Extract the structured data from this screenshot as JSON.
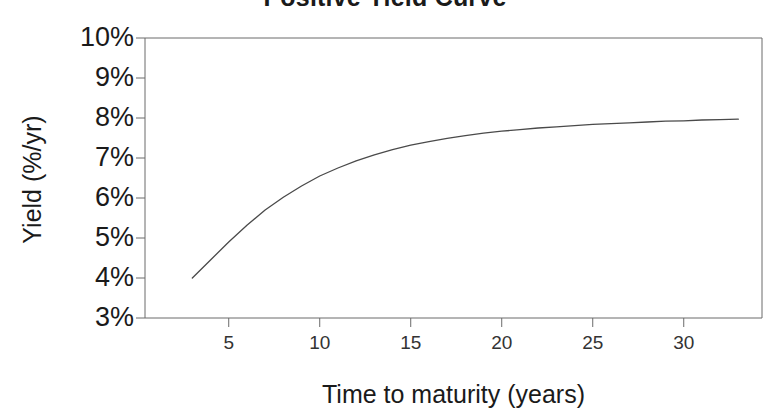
{
  "figure": {
    "width": 770,
    "height": 419,
    "background": "#ffffff",
    "line_color": "#4a4a4a",
    "axis_color": "#6b6b6b",
    "text_color": "#1a1a1a"
  },
  "chart_data": {
    "type": "line",
    "title": "Positive Yield Curve",
    "xlabel": "Time to maturity (years)",
    "ylabel": "Yield (%/yr)",
    "xlim": [
      0.4,
      34.3
    ],
    "ylim": [
      3,
      10
    ],
    "grid": false,
    "legend": null,
    "xticks": [
      5,
      10,
      15,
      20,
      25,
      30
    ],
    "xtick_labels": [
      "5",
      "10",
      "15",
      "20",
      "25",
      "30"
    ],
    "yticks": [
      3,
      4,
      5,
      6,
      7,
      8,
      9,
      10
    ],
    "ytick_labels": [
      "3%",
      "4%",
      "5%",
      "6%",
      "7%",
      "8%",
      "9%",
      "10%"
    ],
    "series": [
      {
        "name": "Yield curve",
        "x": [
          3,
          4,
          5,
          6,
          7,
          8,
          9,
          10,
          11,
          12,
          13,
          14,
          15,
          16,
          17,
          18,
          19,
          20,
          21,
          22,
          23,
          24,
          25,
          26,
          27,
          28,
          29,
          30,
          31,
          32,
          33
        ],
        "y": [
          4.0,
          4.45,
          4.9,
          5.32,
          5.7,
          6.02,
          6.3,
          6.55,
          6.75,
          6.93,
          7.08,
          7.21,
          7.32,
          7.41,
          7.49,
          7.56,
          7.62,
          7.67,
          7.71,
          7.75,
          7.78,
          7.81,
          7.84,
          7.86,
          7.88,
          7.9,
          7.92,
          7.93,
          7.95,
          7.96,
          7.97
        ]
      }
    ]
  }
}
